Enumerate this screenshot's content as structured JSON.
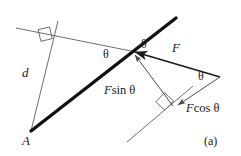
{
  "figure": {
    "caption": "(a)",
    "colors": {
      "background": "#ffffff",
      "thick_line": "#111111",
      "thin_line": "#5d5d5d",
      "text": "#1a1a1a"
    },
    "labels": [
      {
        "id": "point-a",
        "text": "A",
        "kind": "italic",
        "size": "sz-14",
        "x": 22,
        "y": 134
      },
      {
        "id": "distance-d",
        "text": "d",
        "kind": "italic",
        "size": "sz-14",
        "x": 22,
        "y": 66
      },
      {
        "id": "theta-left",
        "text": "θ",
        "kind": "theta",
        "size": "sz-12",
        "x": 103,
        "y": 48
      },
      {
        "id": "theta-top",
        "text": "θ",
        "kind": "theta",
        "size": "sz-12",
        "x": 141,
        "y": 38
      },
      {
        "id": "force-f",
        "text": "F",
        "kind": "italic",
        "size": "sz-14",
        "x": 172,
        "y": 41
      },
      {
        "id": "theta-right",
        "text": "θ",
        "kind": "theta",
        "size": "sz-12",
        "x": 198,
        "y": 70
      },
      {
        "id": "f-sin",
        "text": "F",
        "suffix": "sin θ",
        "kind": "italic",
        "size": "sz-13",
        "x": 104,
        "y": 84
      },
      {
        "id": "f-cos",
        "text": "F",
        "suffix": "cos θ",
        "kind": "italic",
        "size": "sz-13",
        "x": 186,
        "y": 102
      },
      {
        "id": "caption",
        "text": "(a)",
        "kind": "roman",
        "size": "sz-12",
        "x": 204,
        "y": 135
      }
    ],
    "geometry": {
      "bar": {
        "name": "rigid-bar",
        "x1": 31,
        "y1": 131,
        "x2": 176,
        "y2": 18,
        "width": 3.4
      },
      "moment_arm": {
        "name": "moment-arm-d",
        "x1": 31,
        "y1": 131,
        "x2": 58,
        "y2": 21,
        "width": 0.9
      },
      "perp_line": {
        "name": "perpendicular-construction-line",
        "x1": 16,
        "y1": 28,
        "x2": 131,
        "y2": 51,
        "width": 0.9
      },
      "component_axis": {
        "name": "component-axis-line",
        "x1": 127,
        "y1": 142,
        "x2": 193,
        "y2": 86,
        "width": 0.9
      },
      "vector_f": {
        "name": "vector-f",
        "x1": 220,
        "y1": 77,
        "x2": 132,
        "y2": 51,
        "width": 1.6
      },
      "vector_fsin": {
        "name": "vector-f-sin-theta",
        "x1": 173,
        "y1": 106,
        "x2": 132,
        "y2": 51,
        "width": 0.9
      },
      "vector_fcos": {
        "name": "vector-f-cos-theta",
        "x1": 220,
        "y1": 77,
        "x2": 176,
        "y2": 106,
        "width": 0.9
      },
      "right_angle_upper": {
        "name": "right-angle-marker-upper",
        "cx": 45,
        "cy": 32
      },
      "right_angle_lower": {
        "name": "right-angle-marker-lower",
        "cx": 165,
        "cy": 105
      }
    }
  }
}
